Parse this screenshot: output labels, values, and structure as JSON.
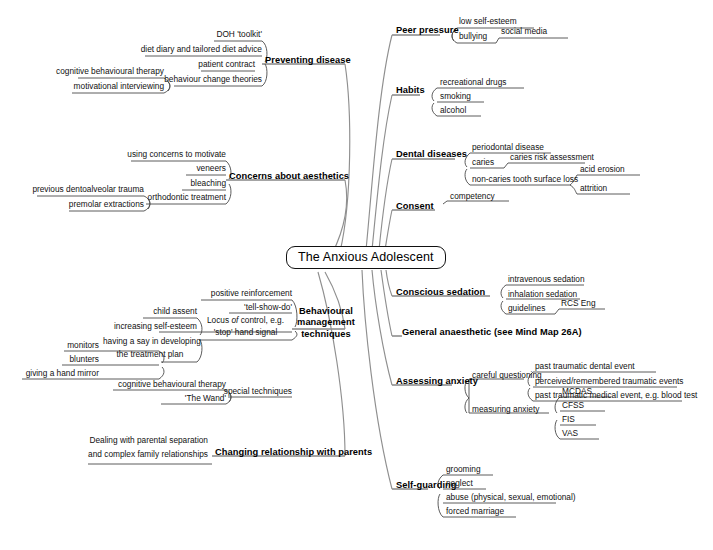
{
  "title": "The Anxious Adolescent",
  "diagram": {
    "type": "mind-map",
    "root": "The Anxious Adolescent",
    "style": {
      "root_border": "#111111",
      "connector_color": "#8c8c8c",
      "text_color": "#111111",
      "background": "#ffffff"
    },
    "branches": [
      {
        "id": "preventing-disease",
        "label": "Preventing disease",
        "side": "left",
        "children": [
          {
            "label": "DOH 'toolkit'"
          },
          {
            "label": "diet diary and tailored diet advice"
          },
          {
            "label": "patient contract"
          },
          {
            "label": "behaviour change theories",
            "children": [
              {
                "label": "cognitive behavioural therapy"
              },
              {
                "label": "motivational interviewing"
              }
            ]
          }
        ]
      },
      {
        "id": "concerns-about-aesthetics",
        "label": "Concerns about aesthetics",
        "side": "left",
        "children": [
          {
            "label": "using concerns to motivate"
          },
          {
            "label": "veneers"
          },
          {
            "label": "bleaching"
          },
          {
            "label": "orthodontic treatment",
            "children": [
              {
                "label": "previous dentoalveolar trauma"
              },
              {
                "label": "premolar extractions"
              }
            ]
          }
        ]
      },
      {
        "id": "behavioural-management-techniques",
        "label": "Behavioural management techniques",
        "label_lines": [
          "Behavioural",
          "management",
          "techniques"
        ],
        "side": "left",
        "children": [
          {
            "label": "positive reinforcement"
          },
          {
            "label": "'tell-show-do'"
          },
          {
            "label": "Locus of control, e.g. 'stop' hand signal",
            "label_lines": [
              "Locus of control, e.g.",
              "'stop' hand signal"
            ]
          },
          {
            "label": "increasing self-esteem",
            "children": [
              {
                "label": "child assent"
              },
              {
                "label": "having a say in developing the treatment plan",
                "label_lines": [
                  "having a say in developing",
                  "the treatment plan"
                ],
                "children": [
                  {
                    "label": "monitors"
                  },
                  {
                    "label": "blunters"
                  },
                  {
                    "label": "giving a hand mirror"
                  }
                ]
              }
            ]
          },
          {
            "label": "special techniques",
            "children": [
              {
                "label": "cognitive behavioural therapy"
              },
              {
                "label": "'The Wand'"
              }
            ]
          }
        ]
      },
      {
        "id": "changing-relationship-with-parents",
        "label": "Changing relationship with parents",
        "side": "left",
        "children": [
          {
            "label": "Dealing with parental separation and complex family relationships",
            "label_lines": [
              "Dealing with parental separation",
              "and complex family relationships"
            ]
          }
        ]
      },
      {
        "id": "peer-pressure",
        "label": "Peer pressure",
        "side": "right",
        "children": [
          {
            "label": "low self-esteem"
          },
          {
            "label": "bullying",
            "children": [
              {
                "label": "social media"
              }
            ]
          }
        ]
      },
      {
        "id": "habits",
        "label": "Habits",
        "side": "right",
        "children": [
          {
            "label": "recreational drugs"
          },
          {
            "label": "smoking"
          },
          {
            "label": "alcohol"
          }
        ]
      },
      {
        "id": "dental-diseases",
        "label": "Dental diseases",
        "side": "right",
        "children": [
          {
            "label": "periodontal disease"
          },
          {
            "label": "caries",
            "children": [
              {
                "label": "caries risk assessment"
              }
            ]
          },
          {
            "label": "non-caries tooth surface loss",
            "children": [
              {
                "label": "acid erosion"
              },
              {
                "label": "attrition"
              }
            ]
          }
        ]
      },
      {
        "id": "consent",
        "label": "Consent",
        "side": "right",
        "children": [
          {
            "label": "competency"
          }
        ]
      },
      {
        "id": "conscious-sedation",
        "label": "Conscious sedation",
        "side": "right",
        "children": [
          {
            "label": "intravenous sedation"
          },
          {
            "label": "inhalation sedation"
          },
          {
            "label": "guidelines",
            "children": [
              {
                "label": "RCS Eng"
              }
            ]
          }
        ]
      },
      {
        "id": "general-anaesthetic",
        "label": "General anaesthetic (see Mind Map 26A)",
        "side": "right",
        "children": []
      },
      {
        "id": "assessing-anxiety",
        "label": "Assessing anxiety",
        "side": "right",
        "children": [
          {
            "label": "careful questioning",
            "children": [
              {
                "label": "past traumatic dental event"
              },
              {
                "label": "perceived/remembered traumatic events"
              },
              {
                "label": "past traumatic medical event, e.g. blood test"
              }
            ]
          },
          {
            "label": "measuring anxiety",
            "children": [
              {
                "label": "MCDAS"
              },
              {
                "label": "CFSS"
              },
              {
                "label": "FIS"
              },
              {
                "label": "VAS"
              }
            ]
          }
        ]
      },
      {
        "id": "self-guarding",
        "label": "Self-guarding",
        "side": "right",
        "children": [
          {
            "label": "grooming"
          },
          {
            "label": "neglect"
          },
          {
            "label": "abuse (physical, sexual, emotional)"
          },
          {
            "label": "forced marriage"
          }
        ]
      }
    ]
  },
  "labels": {
    "root": "The Anxious Adolescent",
    "preventing_disease": "Preventing disease",
    "doh_toolkit": "DOH 'toolkit'",
    "diet_diary": "diet diary and tailored diet advice",
    "patient_contract": "patient contract",
    "behaviour_change_theories": "behaviour change theories",
    "cbt_1": "cognitive behavioural therapy",
    "motivational_interviewing": "motivational interviewing",
    "concerns_aesthetics": "Concerns about aesthetics",
    "using_concerns": "using concerns to motivate",
    "veneers": "veneers",
    "bleaching": "bleaching",
    "orthodontic_treatment": "orthodontic treatment",
    "dentoalveolar_trauma": "previous dentoalveolar trauma",
    "premolar_extractions": "premolar extractions",
    "bmt_line1": "Behavioural",
    "bmt_line2": "management",
    "bmt_line3": "techniques",
    "positive_reinforcement": "positive reinforcement",
    "tell_show_do": "'tell-show-do'",
    "locus_line1_a": "Locus",
    "locus_line1_b": "of",
    "locus_line1_c": "control, e.g.",
    "locus_line2": "'stop' hand signal",
    "child_assent": "child assent",
    "increasing_self_esteem": "increasing self-esteem",
    "having_a_say_1": "having a say in developing",
    "having_a_say_2": "the treatment plan",
    "monitors": "monitors",
    "blunters": "blunters",
    "hand_mirror": "giving a hand mirror",
    "special_techniques": "special techniques",
    "cbt_2": "cognitive behavioural therapy",
    "the_wand": "'The Wand'",
    "changing_relationship": "Changing relationship with parents",
    "dealing_1": "Dealing with parental separation",
    "dealing_2": "and complex family relationships",
    "peer_pressure": "Peer pressure",
    "low_self_esteem": "low self-esteem",
    "bullying": "bullying",
    "social_media": "social media",
    "habits": "Habits",
    "recreational_drugs": "recreational drugs",
    "smoking": "smoking",
    "alcohol": "alcohol",
    "dental_diseases": "Dental diseases",
    "periodontal_disease": "periodontal disease",
    "caries": "caries",
    "caries_risk": "caries risk assessment",
    "non_caries": "non-caries tooth surface loss",
    "acid_erosion": "acid erosion",
    "attrition": "attrition",
    "consent": "Consent",
    "competency": "competency",
    "conscious_sedation": "Conscious sedation",
    "iv_sedation": "intravenous sedation",
    "inhalation_sedation": "inhalation sedation",
    "guidelines": "guidelines",
    "rcs_eng": "RCS Eng",
    "general_anaesthetic": "General anaesthetic (see Mind Map 26A)",
    "assessing_anxiety": "Assessing anxiety",
    "careful_questioning": "careful questioning",
    "past_dental": "past traumatic dental event",
    "perceived_remembered": "perceived/remembered traumatic events",
    "past_medical": "past traumatic medical event, e.g. blood test",
    "measuring_anxiety": "measuring anxiety",
    "mcdas": "MCDAS",
    "cfss": "CFSS",
    "fis": "FIS",
    "vas": "VAS",
    "self_guarding": "Self-guarding",
    "grooming": "grooming",
    "neglect": "neglect",
    "abuse": "abuse (physical, sexual, emotional)",
    "forced_marriage": "forced marriage"
  }
}
